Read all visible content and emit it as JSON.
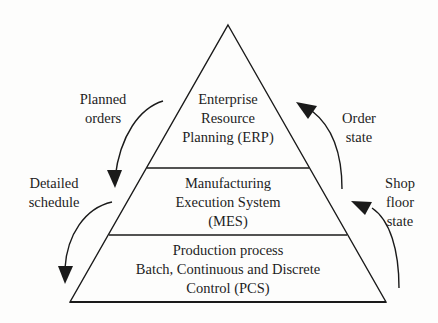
{
  "diagram": {
    "type": "pyramid",
    "colors": {
      "line": "#1a1a1a",
      "text": "#1e1e1e",
      "background": "#fdfdfc"
    },
    "layers": [
      {
        "id": "erp",
        "lines": [
          "Enterprise",
          "Resource",
          "Planning (ERP)"
        ]
      },
      {
        "id": "mes",
        "lines": [
          "Manufacturing",
          "Execution System",
          "(MES)"
        ]
      },
      {
        "id": "pcs",
        "lines": [
          "Production process",
          "Batch, Continuous and Discrete",
          "Control (PCS)"
        ]
      }
    ],
    "flows_down": [
      {
        "id": "planned-orders",
        "lines": [
          "Planned",
          "orders"
        ],
        "from": "erp",
        "to": "mes"
      },
      {
        "id": "detailed-schedule",
        "lines": [
          "Detailed",
          "schedule"
        ],
        "from": "mes",
        "to": "pcs"
      }
    ],
    "flows_up": [
      {
        "id": "order-state",
        "lines": [
          "Order",
          "state"
        ],
        "from": "mes",
        "to": "erp"
      },
      {
        "id": "shop-floor-state",
        "lines": [
          "Shop",
          "floor",
          "state"
        ],
        "from": "pcs",
        "to": "mes"
      }
    ]
  }
}
